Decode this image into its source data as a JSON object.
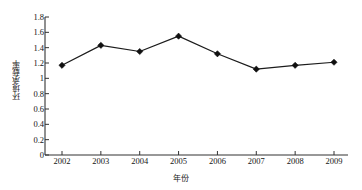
{
  "chart_data": {
    "type": "line",
    "title": "",
    "subtitle": "",
    "xlabel": "年份",
    "ylabel": "环境承载率",
    "categories": [
      "2002",
      "2003",
      "2004",
      "2005",
      "2006",
      "2007",
      "2008",
      "2009"
    ],
    "x": [
      2002,
      2003,
      2004,
      2005,
      2006,
      2007,
      2008,
      2009
    ],
    "values": [
      1.17,
      1.43,
      1.35,
      1.55,
      1.32,
      1.12,
      1.17,
      1.21
    ],
    "series": [
      {
        "name": "环境承载率",
        "values": [
          1.17,
          1.43,
          1.35,
          1.55,
          1.32,
          1.12,
          1.17,
          1.21
        ]
      }
    ],
    "ylim": [
      0,
      1.8
    ],
    "ytick_values": [
      0,
      0.2,
      0.4,
      0.6,
      0.8,
      1,
      1.2,
      1.4,
      1.6,
      1.8
    ],
    "ytick_labels": [
      "0",
      "0.2",
      "0.4",
      "0.6",
      "0.8",
      "1",
      "1.2",
      "1.4",
      "1.6",
      "1.8"
    ],
    "xtick_labels": [
      "2002",
      "2003",
      "2004",
      "2005",
      "2006",
      "2007",
      "2008",
      "2009"
    ],
    "grid": false,
    "legend": "none",
    "marker": "diamond",
    "line_color": "#1c1c1c",
    "marker_color": "#101010",
    "axis_color": "#333333",
    "background_color": "#ffffff"
  }
}
